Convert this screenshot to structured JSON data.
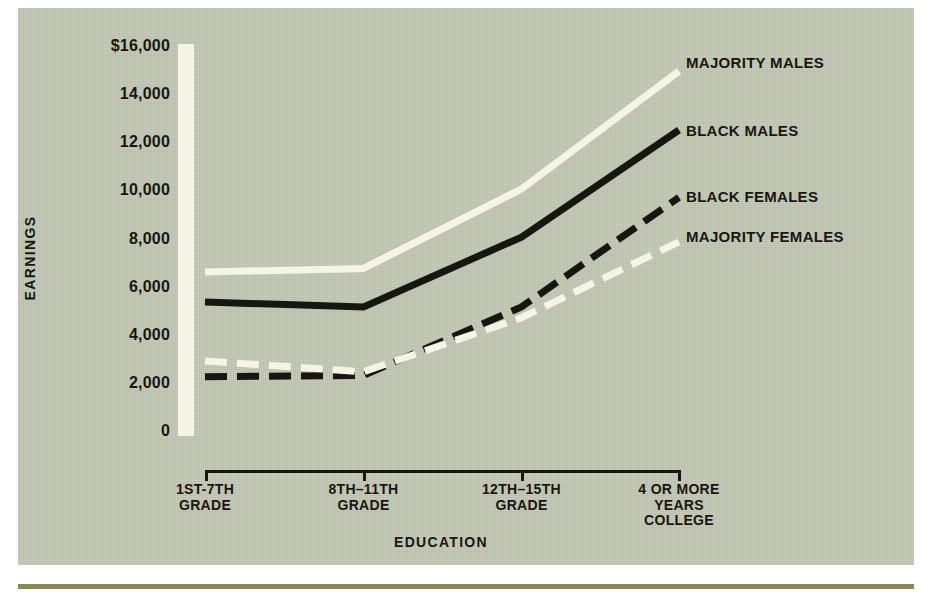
{
  "chart_data": {
    "type": "line",
    "title": "",
    "xlabel": "EDUCATION",
    "ylabel": "EARNINGS",
    "categories": [
      "1ST-7TH GRADE",
      "8TH–11TH GRADE",
      "12TH–15TH GRADE",
      "4 OR MORE YEARS COLLEGE"
    ],
    "category_lines": [
      [
        "1ST-7TH",
        "GRADE"
      ],
      [
        "8TH–11TH",
        "GRADE"
      ],
      [
        "12TH–15TH",
        "GRADE"
      ],
      [
        "4 OR MORE",
        "YEARS",
        "COLLEGE"
      ]
    ],
    "ylim": [
      0,
      16000
    ],
    "yticks": [
      0,
      2000,
      4000,
      6000,
      8000,
      10000,
      12000,
      14000,
      16000
    ],
    "ytick_labels": [
      "0",
      "2,000",
      "4,000",
      "6,000",
      "8,000",
      "10,000",
      "12,000",
      "14,000",
      "$16,000"
    ],
    "grid": false,
    "legend_position": "right-inline",
    "series": [
      {
        "name": "MAJORITY MALES",
        "style": "solid",
        "color": "#f6f4e6",
        "values": [
          6650,
          6800,
          10100,
          15000
        ],
        "label_x": 686,
        "label_y": 54
      },
      {
        "name": "BLACK MALES",
        "style": "solid",
        "color": "#17170f",
        "values": [
          5400,
          5200,
          8100,
          12550
        ],
        "label_x": 686,
        "label_y": 122
      },
      {
        "name": "BLACK FEMALES",
        "style": "dashed",
        "color": "#17170f",
        "values": [
          2300,
          2350,
          5200,
          9750
        ],
        "label_x": 686,
        "label_y": 188
      },
      {
        "name": "MAJORITY FEMALES",
        "style": "dashed",
        "color": "#f6f4e6",
        "values": [
          2950,
          2500,
          4750,
          7900
        ],
        "label_x": 686,
        "label_y": 228
      }
    ]
  },
  "colors": {
    "panel_background": "#c3c8b4",
    "ink": "#17170f",
    "light_line": "#f6f4e6",
    "bottom_rule": "#8a8a52"
  }
}
